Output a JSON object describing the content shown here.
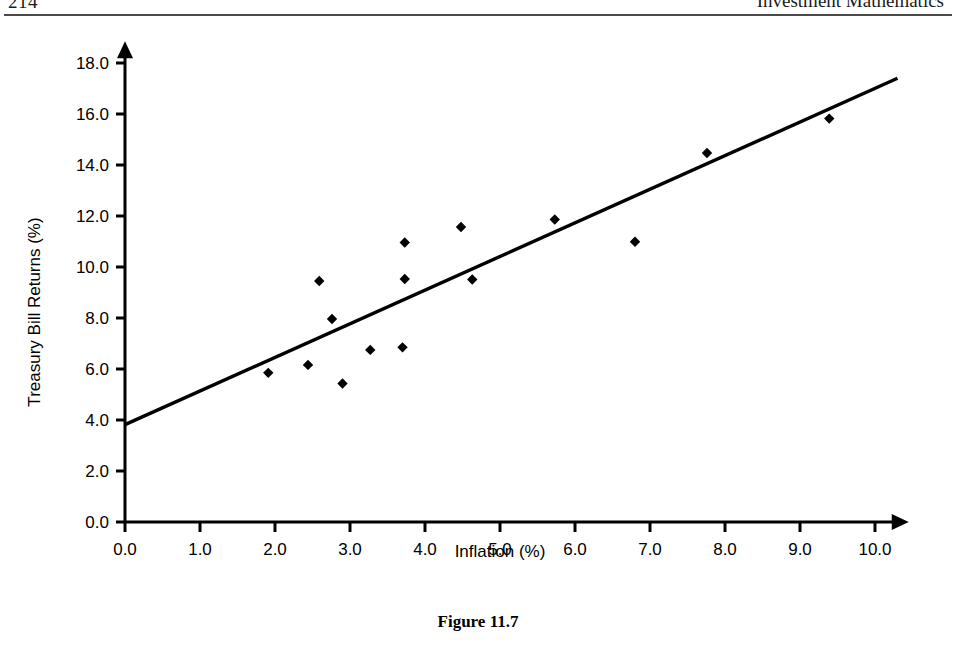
{
  "page": {
    "folio": "214",
    "running_head": "Investment Mathematics"
  },
  "figure": {
    "caption": "Figure 11.7"
  },
  "chart_data": {
    "type": "scatter",
    "title": "",
    "xlabel": "Inflation (%)",
    "ylabel": "Treasury Bill Returns (%)",
    "xlim": [
      0.0,
      10.0
    ],
    "ylim": [
      0.0,
      18.0
    ],
    "xticks": [
      "0.0",
      "1.0",
      "2.0",
      "3.0",
      "4.0",
      "5.0",
      "6.0",
      "7.0",
      "8.0",
      "9.0",
      "10.0"
    ],
    "yticks": [
      "0.0",
      "2.0",
      "4.0",
      "6.0",
      "8.0",
      "10.0",
      "12.0",
      "14.0",
      "16.0",
      "18.0"
    ],
    "xtick_values": [
      0,
      1,
      2,
      3,
      4,
      5,
      6,
      7,
      8,
      9,
      10
    ],
    "ytick_values": [
      0,
      2,
      4,
      6,
      8,
      10,
      12,
      14,
      16,
      18
    ],
    "grid": false,
    "legend": null,
    "marker": "diamond",
    "marker_color": "#000000",
    "points": [
      {
        "x": 1.91,
        "y": 5.85
      },
      {
        "x": 2.44,
        "y": 6.16
      },
      {
        "x": 2.59,
        "y": 9.45
      },
      {
        "x": 2.76,
        "y": 7.96
      },
      {
        "x": 2.9,
        "y": 5.43
      },
      {
        "x": 3.27,
        "y": 6.75
      },
      {
        "x": 3.7,
        "y": 6.85
      },
      {
        "x": 3.73,
        "y": 9.53
      },
      {
        "x": 3.73,
        "y": 10.96
      },
      {
        "x": 4.48,
        "y": 11.57
      },
      {
        "x": 4.63,
        "y": 9.51
      },
      {
        "x": 5.73,
        "y": 11.86
      },
      {
        "x": 6.8,
        "y": 10.99
      },
      {
        "x": 7.76,
        "y": 14.47
      },
      {
        "x": 9.39,
        "y": 15.82
      }
    ],
    "trendline": {
      "type": "linear-fit",
      "color": "#000000",
      "x_start": 0.0,
      "y_start": 3.82,
      "x_end": 10.3,
      "y_end": 17.4,
      "slope": 1.32,
      "intercept": 3.82
    }
  }
}
